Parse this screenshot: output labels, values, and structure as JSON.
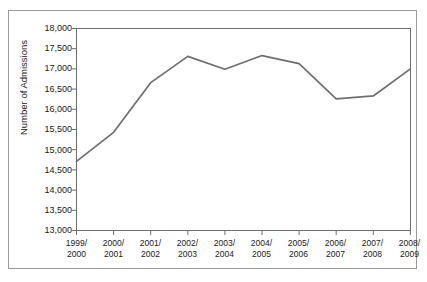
{
  "chart_data": {
    "type": "line",
    "title": "",
    "subtitle": "",
    "xlabel": "",
    "ylabel": "Number of Admissions",
    "categories": [
      "1999/\n2000",
      "2000/\n2001",
      "2001/\n2002",
      "2002/\n2003",
      "2003/\n2004",
      "2004/\n2005",
      "2005/\n2006",
      "2006/\n2007",
      "2007/\n2008",
      "2008/\n2009"
    ],
    "category_lines": [
      [
        "1999/",
        "2000"
      ],
      [
        "2000/",
        "2001"
      ],
      [
        "2001/",
        "2002"
      ],
      [
        "2002/",
        "2003"
      ],
      [
        "2003/",
        "2004"
      ],
      [
        "2004/",
        "2005"
      ],
      [
        "2005/",
        "2006"
      ],
      [
        "2006/",
        "2007"
      ],
      [
        "2007/",
        "2008"
      ],
      [
        "2008/",
        "2009"
      ]
    ],
    "values": [
      14710,
      15430,
      16660,
      17310,
      16990,
      17330,
      17130,
      16260,
      16330,
      17000
    ],
    "series": [
      {
        "name": "Number of Admissions",
        "values": [
          14710,
          15430,
          16660,
          17310,
          16990,
          17330,
          17130,
          16260,
          16330,
          17000
        ],
        "color": "#6e6e6e"
      }
    ],
    "ylim": [
      13000,
      18000
    ],
    "ytick_values": [
      13000,
      13500,
      14000,
      14500,
      15000,
      15500,
      16000,
      16500,
      17000,
      17500,
      18000
    ],
    "ytick_labels": [
      "13,000",
      "13,500",
      "14,000",
      "14,500",
      "15,000",
      "15,500",
      "16,000",
      "16,500",
      "17,000",
      "17,500",
      "18,000"
    ],
    "grid": false,
    "legend": "none",
    "line_color": "#6e6e6e",
    "axis_color": "#6e6e6e",
    "frame_color": "#9a9a9a",
    "background": "#ffffff"
  }
}
